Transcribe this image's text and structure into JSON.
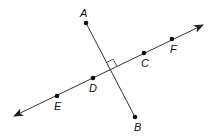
{
  "diagram": {
    "colors": {
      "stroke": "#333333",
      "point": "#111111",
      "text": "#111111"
    },
    "line_EF": {
      "x1": 14,
      "y1": 116,
      "x2": 203,
      "y2": 25,
      "arrows": "both"
    },
    "segment_AB": {
      "x1": 86,
      "y1": 23,
      "x2": 135,
      "y2": 117
    },
    "right_angle_marker": true,
    "points": [
      {
        "name": "A",
        "x": 86,
        "y": 23,
        "lx": 80,
        "ly": 17
      },
      {
        "name": "B",
        "x": 135,
        "y": 117,
        "lx": 134,
        "ly": 131
      },
      {
        "name": "C",
        "x": 144,
        "y": 53,
        "lx": 141,
        "ly": 67
      },
      {
        "name": "D",
        "x": 93,
        "y": 78,
        "lx": 89,
        "ly": 92
      },
      {
        "name": "E",
        "x": 57,
        "y": 96,
        "lx": 54,
        "ly": 110
      },
      {
        "name": "F",
        "x": 172,
        "y": 39,
        "lx": 170,
        "ly": 53
      }
    ]
  }
}
